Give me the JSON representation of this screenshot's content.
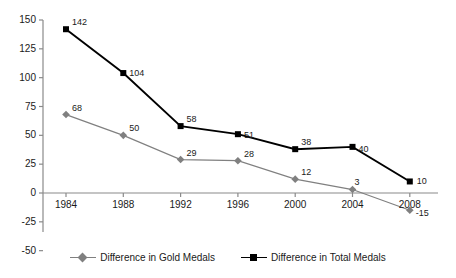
{
  "chart_data": {
    "type": "line",
    "title": "",
    "subtitle": "",
    "xlabel": "",
    "ylabel": "",
    "categories": [
      "1984",
      "1988",
      "1992",
      "1996",
      "2000",
      "2004",
      "2008"
    ],
    "ylim": [
      -50,
      150
    ],
    "yticks": [
      "150",
      "125",
      "100",
      "75",
      "50",
      "25",
      "0",
      "-25",
      "-50"
    ],
    "ytick_values": [
      150,
      125,
      100,
      75,
      50,
      25,
      0,
      -25,
      -50
    ],
    "grid": false,
    "legend_position": "bottom",
    "series": [
      {
        "name": "Difference in Gold Medals",
        "color": "#808080",
        "marker": "diamond",
        "values": [
          68,
          50,
          29,
          28,
          12,
          3,
          -15
        ],
        "labels": [
          "68",
          "50",
          "29",
          "28",
          "12",
          "3",
          "-15"
        ]
      },
      {
        "name": "Difference in Total Medals",
        "color": "#000000",
        "marker": "square",
        "values": [
          142,
          104,
          58,
          51,
          38,
          40,
          10
        ],
        "labels": [
          "142",
          "104",
          "58",
          "51",
          "38",
          "40",
          "10"
        ]
      }
    ]
  },
  "legend": {
    "items": [
      {
        "label": "Difference in Gold Medals",
        "color": "#808080",
        "marker": "diamond"
      },
      {
        "label": "Difference in Total Medals",
        "color": "#000000",
        "marker": "square"
      }
    ]
  },
  "axis": {
    "axis_color": "#8a8a8a",
    "zero_line_color": "#8a8a8a"
  }
}
